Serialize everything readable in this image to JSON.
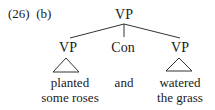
{
  "example": {
    "number": "(26)",
    "sub": "(b)"
  },
  "tree": {
    "root": "VP",
    "children": [
      {
        "label": "VP",
        "type": "triangle",
        "leaf_lines": [
          "planted",
          "some roses"
        ]
      },
      {
        "label": "Con",
        "type": "line",
        "leaf_lines": [
          "and"
        ]
      },
      {
        "label": "VP",
        "type": "triangle",
        "leaf_lines": [
          "watered",
          "the grass"
        ]
      }
    ]
  }
}
